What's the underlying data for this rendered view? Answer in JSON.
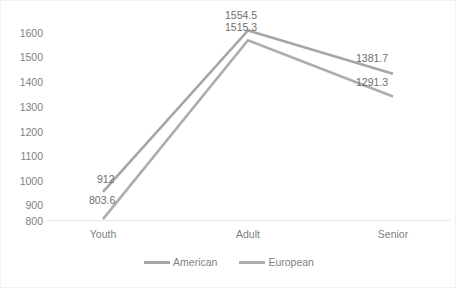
{
  "chart_data": {
    "type": "line",
    "title": "",
    "xlabel": "",
    "ylabel": "",
    "categories": [
      "Youth",
      "Adult",
      "Senior"
    ],
    "series": [
      {
        "name": "American",
        "values": [
          912,
          1554.5,
          1381.7
        ],
        "value_labels": [
          "912",
          "1554.5",
          "1381.7"
        ],
        "color": "#a6a6a6"
      },
      {
        "name": "European",
        "values": [
          803.6,
          1515.3,
          1291.3
        ],
        "value_labels": [
          "803.6",
          "1515.3",
          "1291.3"
        ],
        "color": "#adadad"
      }
    ],
    "ylim": [
      800,
      1600
    ],
    "ytick_step": 100,
    "yticks": [
      "1600",
      "1500",
      "1400",
      "1300",
      "1200",
      "1100",
      "1000",
      "900",
      "800"
    ],
    "grid": false,
    "legend_position": "bottom",
    "axis_line_color": "#e8e8e8",
    "tick_label_color": "#7f7f7f",
    "data_label_color": "#6e6e6e",
    "plot_background": "#ffffff",
    "border_color": "#f2f2f2"
  },
  "legend": {
    "entries": [
      {
        "label": "American"
      },
      {
        "label": "European"
      }
    ]
  }
}
